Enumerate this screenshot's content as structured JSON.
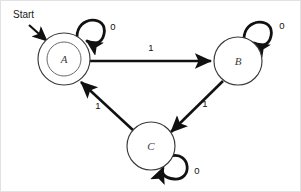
{
  "diagram": {
    "type": "state-transition-diagram",
    "background_color": "#ffffff",
    "stroke_color": "#111111",
    "start_label": "Start",
    "states": [
      {
        "id": "A",
        "label": "A",
        "accepting": true,
        "cx": 63,
        "cy": 58,
        "r": 26,
        "inner_r": 17
      },
      {
        "id": "B",
        "label": "B",
        "accepting": false,
        "cx": 237,
        "cy": 60,
        "r": 24,
        "inner_r": 0
      },
      {
        "id": "C",
        "label": "C",
        "accepting": false,
        "cx": 150,
        "cy": 145,
        "r": 24,
        "inner_r": 0
      }
    ],
    "transitions": [
      {
        "from": "A",
        "to": "A",
        "label": "0",
        "kind": "self-loop",
        "label_x": 112,
        "label_y": 26
      },
      {
        "from": "A",
        "to": "B",
        "label": "1",
        "kind": "straight",
        "label_x": 150,
        "label_y": 47
      },
      {
        "from": "B",
        "to": "B",
        "label": "0",
        "kind": "self-loop",
        "label_x": 281,
        "label_y": 25
      },
      {
        "from": "B",
        "to": "C",
        "label": "1",
        "kind": "straight",
        "label_x": 204,
        "label_y": 103
      },
      {
        "from": "C",
        "to": "A",
        "label": "1",
        "kind": "straight",
        "label_x": 97,
        "label_y": 105
      },
      {
        "from": "C",
        "to": "C",
        "label": "0",
        "kind": "self-loop",
        "label_x": 196,
        "label_y": 170
      }
    ],
    "start_arrow": {
      "label": "Start",
      "label_x": 12,
      "label_y": 14,
      "from_x": 28,
      "from_y": 24,
      "to_x": 47,
      "to_y": 41
    }
  }
}
